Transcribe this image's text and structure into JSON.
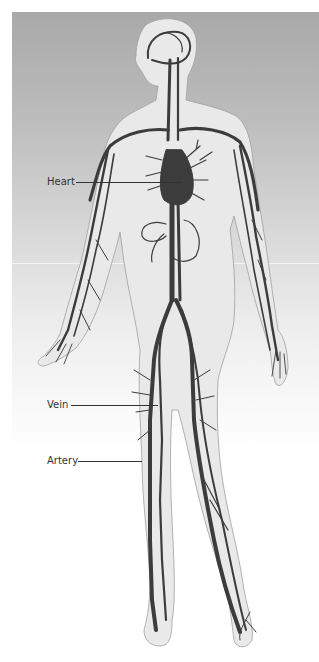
{
  "diagram": {
    "labels": [
      {
        "id": "heart",
        "text": "Heart"
      },
      {
        "id": "vein",
        "text": "Vein"
      },
      {
        "id": "artery",
        "text": "Artery"
      }
    ]
  },
  "colors": {
    "background_top": "#a9a9a9",
    "background_bottom": "#ffffff",
    "body_fill": "#e9e9e9",
    "body_outline": "#9a9a9a",
    "vessel": "#3c3c3c",
    "label_text": "#333333"
  }
}
